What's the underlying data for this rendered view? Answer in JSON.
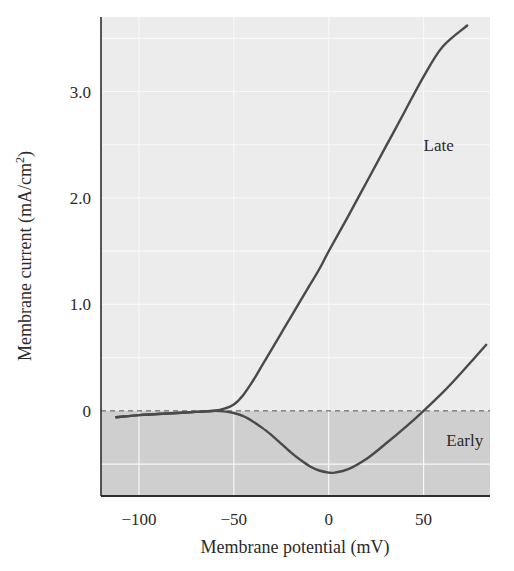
{
  "chart_data": {
    "type": "line",
    "title": "",
    "xlabel": "Membrane potential (mV)",
    "ylabel": "Membrane current (mA/cm",
    "ylabel_sup": "2",
    "ylabel_close": ")",
    "xlim": [
      -120,
      85
    ],
    "ylim": [
      -0.8,
      3.7
    ],
    "x_ticks": [
      -100,
      -50,
      0,
      50
    ],
    "x_tick_labels": [
      "−100",
      "−50",
      "0",
      "50"
    ],
    "y_ticks": [
      0,
      1.0,
      2.0,
      3.0
    ],
    "y_tick_labels": [
      "0",
      "1.0",
      "2.0",
      "3.0"
    ],
    "grid": true,
    "zero_line": "dashed",
    "negative_region_shaded": true,
    "legend": "inline labels",
    "series": [
      {
        "name": "Late",
        "label_position": [
          50,
          2.5
        ],
        "x": [
          -112,
          -100,
          -90,
          -80,
          -70,
          -60,
          -55,
          -50,
          -45,
          -40,
          -35,
          -30,
          -25,
          -20,
          -15,
          -10,
          -5,
          0,
          10,
          20,
          30,
          40,
          50,
          60,
          73
        ],
        "y": [
          -0.06,
          -0.04,
          -0.03,
          -0.02,
          -0.01,
          0.0,
          0.02,
          0.06,
          0.15,
          0.28,
          0.43,
          0.58,
          0.73,
          0.88,
          1.03,
          1.18,
          1.33,
          1.5,
          1.82,
          2.15,
          2.48,
          2.81,
          3.14,
          3.42,
          3.62
        ]
      },
      {
        "name": "Early",
        "label_position": [
          62,
          -0.27
        ],
        "x": [
          -112,
          -100,
          -90,
          -80,
          -70,
          -60,
          -55,
          -50,
          -45,
          -40,
          -35,
          -30,
          -25,
          -20,
          -15,
          -10,
          -5,
          0,
          3,
          10,
          20,
          30,
          40,
          50,
          60,
          70,
          83
        ],
        "y": [
          -0.06,
          -0.04,
          -0.03,
          -0.02,
          -0.01,
          0.0,
          -0.005,
          -0.02,
          -0.05,
          -0.1,
          -0.16,
          -0.23,
          -0.31,
          -0.39,
          -0.46,
          -0.52,
          -0.56,
          -0.58,
          -0.58,
          -0.55,
          -0.45,
          -0.31,
          -0.16,
          0.0,
          0.17,
          0.36,
          0.62
        ]
      }
    ]
  },
  "colors": {
    "upper_region": "#ececec",
    "lower_region": "#cfcfcf",
    "grid": "#f8f8f8",
    "curve": "#4a4a4a",
    "axis": "#2f2f2f",
    "zero_line": "#555555"
  }
}
